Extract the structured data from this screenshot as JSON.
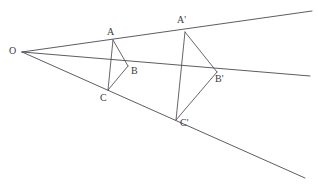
{
  "figure": {
    "type": "geometry-diagram",
    "background_color": "#ffffff",
    "stroke_color": "#4a4a52",
    "label_color": "#3a3a42",
    "width": 318,
    "height": 187
  },
  "points": {
    "O": {
      "label": "O",
      "x": 22,
      "y": 52,
      "label_x": 9,
      "label_y": 46
    },
    "A": {
      "label": "A",
      "x": 113,
      "y": 40,
      "label_x": 107,
      "label_y": 27
    },
    "B": {
      "label": "B",
      "x": 128,
      "y": 66,
      "label_x": 131,
      "label_y": 66
    },
    "C": {
      "label": "C",
      "x": 108,
      "y": 90,
      "label_x": 100,
      "label_y": 93
    },
    "Aprime": {
      "label": "A'",
      "x": 185,
      "y": 32,
      "label_x": 177,
      "label_y": 15
    },
    "Bprime": {
      "label": "B'",
      "x": 217,
      "y": 72,
      "label_x": 215,
      "label_y": 74
    },
    "Cprime": {
      "label": "C'",
      "x": 176,
      "y": 120,
      "label_x": 180,
      "label_y": 118
    }
  },
  "rays": [
    {
      "name": "ray-O-A-Aprime",
      "from": "O",
      "through": "A",
      "to": "Aprime",
      "end_x": 312,
      "end_y": 11
    },
    {
      "name": "ray-O-B-Bprime",
      "from": "O",
      "through": "B",
      "to": "Bprime",
      "end_x": 310,
      "end_y": 76
    },
    {
      "name": "ray-O-C-Cprime",
      "from": "O",
      "through": "C",
      "to": "Cprime",
      "end_x": 305,
      "end_y": 178
    }
  ],
  "triangles": [
    {
      "name": "triangle-ABC",
      "vertices": [
        "A",
        "B",
        "C"
      ]
    },
    {
      "name": "triangle-A-B-C-prime",
      "vertices": [
        "Aprime",
        "Bprime",
        "Cprime"
      ]
    }
  ]
}
